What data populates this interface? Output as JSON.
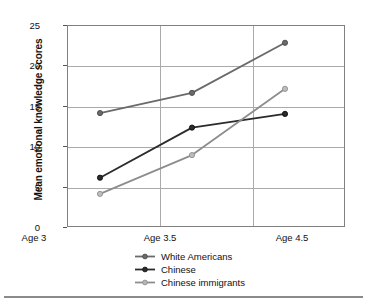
{
  "chart_data": {
    "type": "line",
    "title": "",
    "xlabel": "",
    "ylabel": "Mean emotional knowledge scores",
    "categories": [
      "Age 3",
      "Age 3.5",
      "Age 4.5"
    ],
    "ylim": [
      0,
      25
    ],
    "yticks": [
      0,
      5,
      10,
      15,
      20,
      25
    ],
    "ytick_labels": [
      "0",
      "5",
      "10",
      "15",
      "20",
      "25"
    ],
    "grid": "horizontal-and-vertical",
    "legend_position": "bottom-center",
    "series": [
      {
        "name": "White Americans",
        "color": "#6a6a6a",
        "marker": "circle",
        "values": [
          14.1,
          16.6,
          22.8
        ]
      },
      {
        "name": "Chinese",
        "color": "#2b2b2b",
        "marker": "circle",
        "values": [
          6.1,
          12.3,
          14.0
        ]
      },
      {
        "name": "Chinese immigrants",
        "color": "#8d8d8d",
        "marker": "circle",
        "values": [
          4.1,
          8.9,
          17.1
        ]
      }
    ]
  },
  "axis": {
    "y_title": "Mean emotional knowledge scores",
    "y_tick_0": "0",
    "y_tick_1": "5",
    "y_tick_2": "10",
    "y_tick_3": "15",
    "y_tick_4": "20",
    "y_tick_5": "25",
    "x_tick_0": "Age 3",
    "x_tick_1": "Age 3.5",
    "x_tick_2": "Age 4.5"
  },
  "legend": {
    "items": [
      {
        "label": "White Americans",
        "color": "#6a6a6a"
      },
      {
        "label": "Chinese",
        "color": "#2b2b2b"
      },
      {
        "label": "Chinese immigrants",
        "color": "#8d8d8d"
      }
    ]
  },
  "colors": {
    "frame": "#808080",
    "grid": "#aaaaaa",
    "text": "#111111",
    "rule": "#8a8a8a",
    "background": "#ffffff"
  }
}
